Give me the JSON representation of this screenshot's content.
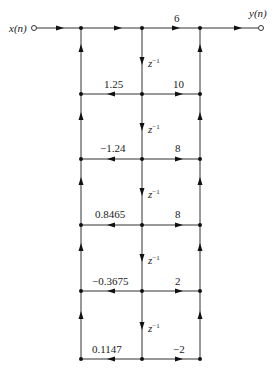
{
  "diagram": {
    "type": "signal-flow-graph",
    "input_label": "x(n)",
    "output_label": "y(n)",
    "delay_label": "z",
    "delay_exponent": "−1",
    "feedforward_top_gain": "6",
    "stages": [
      {
        "feedback": "1.25",
        "feedforward": "10"
      },
      {
        "feedback": "−1.24",
        "feedforward": "8"
      },
      {
        "feedback": "0.8465",
        "feedforward": "8"
      },
      {
        "feedback": "−0.3675",
        "feedforward": "2"
      },
      {
        "feedback": "0.1147",
        "feedforward": "−2"
      }
    ]
  },
  "colors": {
    "line": "#333333",
    "node": "#111111",
    "background": "#ffffff"
  }
}
